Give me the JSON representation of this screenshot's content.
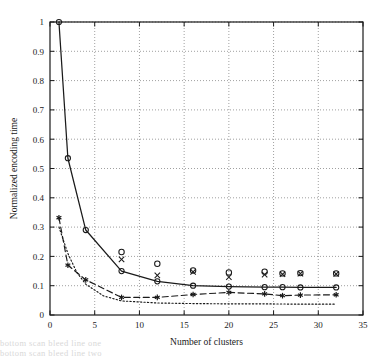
{
  "chart_data": {
    "type": "line",
    "title": "",
    "xlabel": "Number of clusters",
    "ylabel": "Normalized encoding time",
    "xlim": [
      0,
      35
    ],
    "ylim": [
      0,
      1
    ],
    "xticks": [
      0,
      5,
      10,
      15,
      20,
      25,
      30,
      35
    ],
    "xtick_labels": [
      "0",
      "5",
      "10",
      "15",
      "20",
      "25",
      "30",
      "35"
    ],
    "yticks": [
      0,
      0.1,
      0.2,
      0.3,
      0.4,
      0.5,
      0.6,
      0.7,
      0.8,
      0.9,
      1
    ],
    "ytick_labels": [
      "0",
      "0.1",
      "0.2",
      "0.3",
      "0.4",
      "0.5",
      "0.6",
      "0.7",
      "0.8",
      "0.9",
      "1"
    ],
    "grid": true,
    "grid_style": "dotted",
    "legend": "none",
    "series": [
      {
        "name": "solid-curve",
        "style": "solid",
        "marker": "circle",
        "color": "#1a1a1a",
        "x": [
          1,
          2,
          4,
          8,
          12,
          16,
          20,
          24,
          26,
          28,
          32
        ],
        "y": [
          1.0,
          0.535,
          0.29,
          0.15,
          0.115,
          0.1,
          0.097,
          0.095,
          0.095,
          0.094,
          0.094
        ]
      },
      {
        "name": "dashed-curve",
        "style": "dashed",
        "marker": "star",
        "color": "#1a1a1a",
        "x": [
          1,
          2,
          4,
          8,
          12,
          16,
          20,
          24,
          26,
          28,
          32
        ],
        "y": [
          0.332,
          0.17,
          0.12,
          0.06,
          0.06,
          0.07,
          0.077,
          0.072,
          0.066,
          0.068,
          0.069
        ]
      },
      {
        "name": "dotted-curve",
        "style": "dotted",
        "marker": "none",
        "color": "#1a1a1a",
        "x": [
          1,
          2,
          3,
          4,
          6,
          8,
          12,
          16,
          20,
          24,
          28,
          32
        ],
        "y": [
          0.3,
          0.21,
          0.145,
          0.105,
          0.065,
          0.048,
          0.041,
          0.039,
          0.038,
          0.038,
          0.037,
          0.037
        ]
      }
    ],
    "scatter": [
      {
        "name": "circle-points",
        "marker": "circle",
        "color": "#1a1a1a",
        "x": [
          8,
          12,
          16,
          20,
          24,
          26,
          28,
          32
        ],
        "y": [
          0.215,
          0.175,
          0.152,
          0.145,
          0.148,
          0.142,
          0.143,
          0.142
        ]
      },
      {
        "name": "x-points",
        "marker": "x",
        "color": "#1a1a1a",
        "x": [
          8,
          12,
          16,
          20,
          24,
          26,
          28,
          32
        ],
        "y": [
          0.19,
          0.135,
          0.147,
          0.129,
          0.138,
          0.139,
          0.141,
          0.14
        ]
      }
    ]
  },
  "axes": {
    "x_title": "Number of clusters",
    "y_title": "Normalized encoding time"
  },
  "scan_bleed": {
    "line1": "bottom scan bleed line one",
    "line2": "bottom scan bleed line two"
  }
}
